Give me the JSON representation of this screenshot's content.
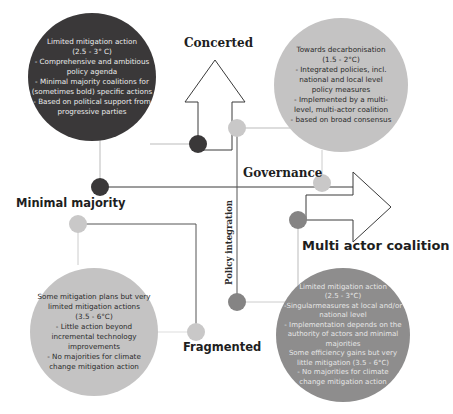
{
  "diagram": {
    "axes": {
      "vertical_top": "Concerted",
      "vertical_bottom": "Fragmented",
      "horizontal_left": "Minimal majority",
      "horizontal_right": "Multi actor coalition",
      "horizontal_axis_name": "Governance",
      "vertical_axis_name": "Policy integration"
    },
    "quadrants": {
      "top_left": {
        "text": "Limited mitigation action\n(2.5 - 3° C)\n- Comprehensive and ambitious\npolicy agenda\n- Minimal majority coalitions for\n(sometimes bold) specific actions\n- Based on political support from\nprogressive parties",
        "color": "#3a3839"
      },
      "top_right": {
        "text": "Towards decarbonisation\n(1.5 - 2°C)\n- Integrated policies, incl.\nnational and local level\npolicy measures\n- Implemented by a multi-\nlevel, multi-actor coalition\n- based on broad consensus",
        "color": "#c4c3c3"
      },
      "bottom_left": {
        "text": "Some mitigation plans but very\nlimited mitigation actions\n(3.5 - 6°C)\n- Little action beyond\nincremental technology\nimprovements\n- No majorities for climate\nchange mitigation action",
        "color": "#c4c3c3"
      },
      "bottom_right": {
        "text": "Limited mitigation action\n(2.5 - 3°C)\n-Singularmeasures at local and/or\nnational level\n- Implementation depends on the\nauthority of actors and minimal\nmajorities\nSome efficiency gains but very\nlittle mitigation (3.5 - 6°C)\n- No majorities for climate\nchange mitigation action",
        "color": "#8e8d8d"
      }
    }
  }
}
